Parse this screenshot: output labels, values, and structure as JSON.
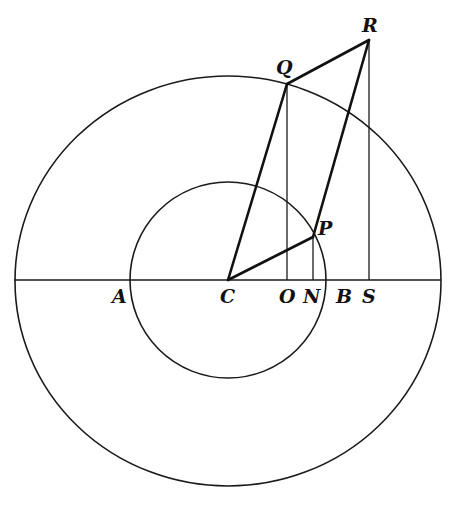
{
  "figure": {
    "points": {
      "A": {
        "label": "A",
        "x": 130,
        "y": 280
      },
      "B": {
        "label": "B",
        "x": 326,
        "y": 280
      },
      "C": {
        "label": "C",
        "x": 228,
        "y": 280
      },
      "O": {
        "label": "O",
        "x": 287,
        "y": 280
      },
      "N": {
        "label": "N",
        "x": 313,
        "y": 280
      },
      "S": {
        "label": "S",
        "x": 369,
        "y": 280
      },
      "P": {
        "label": "P",
        "x": 313,
        "y": 237
      },
      "Q": {
        "label": "Q",
        "x": 287,
        "y": 84
      },
      "R": {
        "label": "R",
        "x": 369,
        "y": 40
      }
    },
    "circles": [
      {
        "name": "outer",
        "cx": 228,
        "cy": 281,
        "rx": 213,
        "ry": 205
      },
      {
        "name": "inner",
        "cx": 228,
        "cy": 280,
        "rx": 98,
        "ry": 98
      }
    ],
    "baseline": {
      "x1": 14,
      "x2": 441,
      "y": 280
    },
    "segments_thick": [
      [
        "C",
        "Q"
      ],
      [
        "Q",
        "R"
      ],
      [
        "R",
        "P"
      ],
      [
        "C",
        "P"
      ]
    ],
    "segments_thin": [
      [
        "Q",
        "O"
      ],
      [
        "P",
        "N"
      ],
      [
        "R",
        "S"
      ]
    ],
    "labels": [
      {
        "key": "R",
        "text": "R",
        "x": 362,
        "y": 32
      },
      {
        "key": "Q",
        "text": "Q",
        "x": 276,
        "y": 74
      },
      {
        "key": "P",
        "text": "P",
        "x": 318,
        "y": 235
      },
      {
        "key": "A",
        "text": "A",
        "x": 112,
        "y": 303
      },
      {
        "key": "C",
        "text": "C",
        "x": 220,
        "y": 303
      },
      {
        "key": "O",
        "text": "O",
        "x": 279,
        "y": 303
      },
      {
        "key": "N",
        "text": "N",
        "x": 303,
        "y": 303
      },
      {
        "key": "B",
        "text": "B",
        "x": 336,
        "y": 303
      },
      {
        "key": "S",
        "text": "S",
        "x": 362,
        "y": 303
      }
    ],
    "colors": {
      "ink": "#111111",
      "paper": "#ffffff"
    }
  }
}
